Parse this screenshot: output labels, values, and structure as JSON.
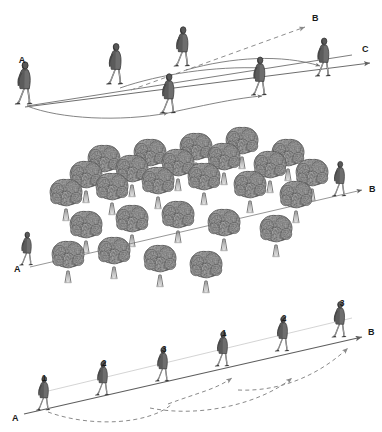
{
  "figure": {
    "background_color": "#ffffff",
    "ink_color": "#3a3a3a",
    "line_color": "#6e6e6e",
    "dash_color": "#8a8a8a",
    "tree_fill": "#7a7a7a",
    "tree_dark": "#5c5c5c",
    "figure_coat": "#6b6b6b",
    "figure_leg": "#e8e8e8"
  },
  "panels": [
    {
      "id": "panel-top",
      "name": "detour-paths-panel",
      "labels": {
        "start": "A",
        "target_upper": "B",
        "target_lower": "C"
      },
      "walkers": [
        {
          "id": "w1",
          "x": 26,
          "y": 104,
          "scale": 1.0
        },
        {
          "id": "w2",
          "x": 117,
          "y": 84,
          "scale": 0.96
        },
        {
          "id": "w3",
          "x": 184,
          "y": 66,
          "scale": 0.93
        },
        {
          "id": "w4",
          "x": 170,
          "y": 113,
          "scale": 0.93
        },
        {
          "id": "w5",
          "x": 261,
          "y": 95,
          "scale": 0.9
        },
        {
          "id": "w6",
          "x": 325,
          "y": 76,
          "scale": 0.9
        }
      ],
      "paths": [
        {
          "id": "line-ac-upper",
          "style": "solid-arrow"
        },
        {
          "id": "line-ac-lower",
          "style": "solid-arrow"
        },
        {
          "id": "line-ab-dashed",
          "style": "dashed-arrow"
        },
        {
          "id": "arc-1",
          "style": "curve-arrow"
        },
        {
          "id": "arc-2",
          "style": "curve-arrow"
        },
        {
          "id": "arc-3",
          "style": "curve-arrow"
        }
      ]
    },
    {
      "id": "panel-middle",
      "name": "tree-grid-panel",
      "labels": {
        "start": "A",
        "target": "B"
      },
      "walkers": [
        {
          "id": "m1",
          "x": 28,
          "y": 265,
          "scale": 0.78
        },
        {
          "id": "m2",
          "x": 340,
          "y": 196,
          "scale": 0.82
        }
      ],
      "tree_rows": [
        {
          "count": 6,
          "y": 205,
          "x0": 55,
          "dx": 47,
          "r": 26
        },
        {
          "count": 6,
          "y": 187,
          "x0": 74,
          "dx": 47,
          "r": 26
        },
        {
          "count": 6,
          "y": 170,
          "x0": 93,
          "dx": 47,
          "r": 25
        },
        {
          "count": 5,
          "y": 232,
          "x0": 74,
          "dx": 47,
          "r": 26
        },
        {
          "count": 5,
          "y": 252,
          "x0": 93,
          "dx": 47,
          "r": 26
        }
      ],
      "paths": [
        {
          "id": "line-ab-through-grove",
          "style": "solid-arrow"
        }
      ]
    },
    {
      "id": "panel-bottom",
      "name": "two-route-panel",
      "labels": {
        "start": "A",
        "target": "B",
        "left_sequence": [
          "1",
          "2",
          "3"
        ],
        "right_sequence": [
          "1",
          "2",
          "3"
        ]
      },
      "walkers": [
        {
          "id": "b1",
          "x": 45,
          "y": 410,
          "scale": 0.8,
          "label": "1"
        },
        {
          "id": "b2",
          "x": 104,
          "y": 395,
          "scale": 0.8,
          "label": "2"
        },
        {
          "id": "b3",
          "x": 164,
          "y": 381,
          "scale": 0.8,
          "label": "3"
        },
        {
          "id": "b4",
          "x": 224,
          "y": 366,
          "scale": 0.82,
          "label": "1"
        },
        {
          "id": "b5",
          "x": 284,
          "y": 351,
          "scale": 0.82,
          "label": "2"
        },
        {
          "id": "b6",
          "x": 341,
          "y": 337,
          "scale": 0.84,
          "label": "3"
        }
      ],
      "paths": [
        {
          "id": "line-ab-straight",
          "style": "solid-arrow"
        },
        {
          "id": "line-ab-faint",
          "style": "thin-line"
        },
        {
          "id": "dashed-loop-1",
          "style": "dashed-curve"
        },
        {
          "id": "dashed-loop-2",
          "style": "dashed-curve"
        },
        {
          "id": "dashed-loop-3",
          "style": "dashed-curve"
        }
      ]
    }
  ]
}
